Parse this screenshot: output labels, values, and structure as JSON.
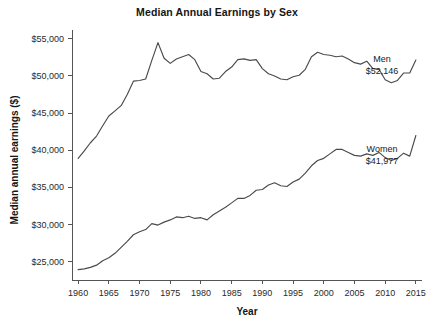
{
  "chart_data": {
    "type": "line",
    "title": "Median Annual Earnings by Sex",
    "xlabel": "Year",
    "ylabel": "Median annual earnings ($)",
    "xlim": [
      1959,
      2016
    ],
    "ylim": [
      22500,
      56200
    ],
    "grid": false,
    "legend_position": "inline-annotation-right",
    "xticks": [
      1960,
      1965,
      1970,
      1975,
      1980,
      1985,
      1990,
      1995,
      2000,
      2005,
      2010,
      2015
    ],
    "xtick_labels": [
      "1960",
      "1965",
      "1970",
      "1975",
      "1980",
      "1985",
      "1990",
      "1995",
      "2000",
      "2005",
      "2010",
      "2015"
    ],
    "yticks": [
      25000,
      30000,
      35000,
      40000,
      45000,
      50000,
      55000
    ],
    "ytick_labels": [
      "$25,000",
      "$30,000",
      "$35,000",
      "$40,000",
      "$45,000",
      "$50,000",
      "$55,000"
    ],
    "x": [
      1960,
      1961,
      1962,
      1963,
      1964,
      1965,
      1966,
      1967,
      1968,
      1969,
      1970,
      1971,
      1972,
      1973,
      1974,
      1975,
      1976,
      1977,
      1978,
      1979,
      1980,
      1981,
      1982,
      1983,
      1984,
      1985,
      1986,
      1987,
      1988,
      1989,
      1990,
      1991,
      1992,
      1993,
      1994,
      1995,
      1996,
      1997,
      1998,
      1999,
      2000,
      2001,
      2002,
      2003,
      2004,
      2005,
      2006,
      2007,
      2008,
      2009,
      2010,
      2011,
      2012,
      2013,
      2014,
      2015
    ],
    "series": [
      {
        "name": "Men",
        "label": "Men",
        "end_value_label": "$52,146",
        "end_value": 52146,
        "color": "#4a4a4a",
        "values": [
          38900,
          39900,
          41000,
          41900,
          43300,
          44600,
          45300,
          46000,
          47500,
          49300,
          49400,
          49600,
          52100,
          54500,
          52400,
          51700,
          52300,
          52600,
          52900,
          52200,
          50600,
          50300,
          49600,
          49700,
          50600,
          51200,
          52200,
          52300,
          52100,
          52200,
          51000,
          50300,
          50000,
          49600,
          49500,
          49900,
          50100,
          50900,
          52600,
          53200,
          52900,
          52800,
          52600,
          52700,
          52300,
          51800,
          51600,
          52000,
          51000,
          50900,
          49500,
          49100,
          49400,
          50400,
          50400,
          52146
        ]
      },
      {
        "name": "Women",
        "label": "Women",
        "end_value_label": "$41,977",
        "end_value": 41977,
        "color": "#4a4a4a",
        "values": [
          23900,
          24000,
          24200,
          24500,
          25100,
          25500,
          26100,
          26900,
          27700,
          28600,
          29000,
          29300,
          30100,
          29900,
          30300,
          30600,
          31000,
          30900,
          31100,
          30800,
          30900,
          30600,
          31300,
          31800,
          32300,
          32900,
          33500,
          33500,
          33900,
          34600,
          34700,
          35300,
          35600,
          35200,
          35100,
          35700,
          36100,
          36900,
          37900,
          38600,
          38900,
          39500,
          40100,
          40100,
          39700,
          39300,
          39200,
          39500,
          39300,
          39700,
          39000,
          38600,
          38900,
          39600,
          39200,
          41977
        ]
      }
    ],
    "annotations": [
      {
        "name": "men-annotation",
        "label": "Men",
        "value_label": "$52,146",
        "x_px": 382,
        "y_px": 62
      },
      {
        "name": "women-annotation",
        "label": "Women",
        "value_label": "$41,977",
        "x_px": 382,
        "y_px": 152
      }
    ]
  }
}
